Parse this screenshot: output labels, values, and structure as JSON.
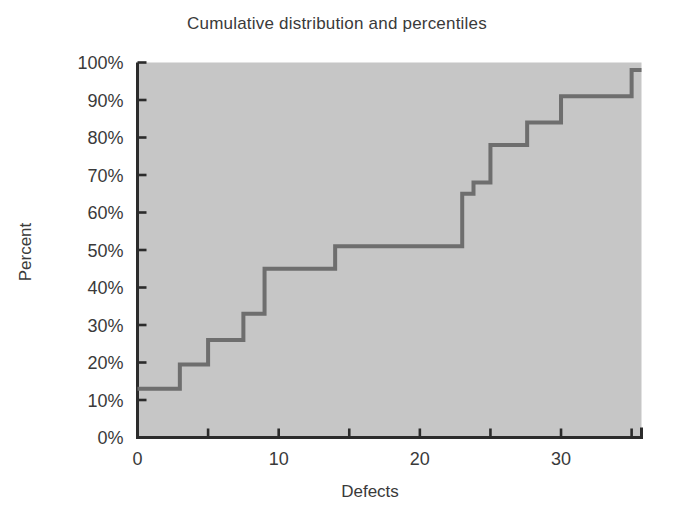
{
  "chart_data": {
    "type": "line",
    "subtype": "step-cumulative",
    "title": "Cumulative distribution and percentiles",
    "xlabel": "Defects",
    "ylabel": "Percent",
    "xlim": [
      0,
      35.7
    ],
    "ylim": [
      0,
      100
    ],
    "xticks": [
      0,
      10,
      20,
      30
    ],
    "xtick_labels": [
      "0",
      "10",
      "20",
      "30"
    ],
    "xminor_ticks": [
      5,
      15,
      25,
      35
    ],
    "yticks": [
      0,
      10,
      20,
      30,
      40,
      50,
      60,
      70,
      80,
      90,
      100
    ],
    "ytick_labels": [
      "0%",
      "10%",
      "20%",
      "30%",
      "40%",
      "50%",
      "60%",
      "70%",
      "80%",
      "90%",
      "100%"
    ],
    "grid": false,
    "legend": false,
    "plot_background": "#c6c6c6",
    "line_color": "#6e6e6e",
    "axis_color": "#2b2b2b",
    "text_color": "#3a3a3a",
    "series": [
      {
        "name": "Cumulative percent",
        "step_points": [
          {
            "x": 0.0,
            "y": 13
          },
          {
            "x": 3.0,
            "y": 13
          },
          {
            "x": 3.0,
            "y": 19.5
          },
          {
            "x": 5.0,
            "y": 19.5
          },
          {
            "x": 5.0,
            "y": 26
          },
          {
            "x": 7.5,
            "y": 26
          },
          {
            "x": 7.5,
            "y": 33
          },
          {
            "x": 9.0,
            "y": 33
          },
          {
            "x": 9.0,
            "y": 45
          },
          {
            "x": 14.0,
            "y": 45
          },
          {
            "x": 14.0,
            "y": 51
          },
          {
            "x": 23.0,
            "y": 51
          },
          {
            "x": 23.0,
            "y": 65
          },
          {
            "x": 23.8,
            "y": 65
          },
          {
            "x": 23.8,
            "y": 68
          },
          {
            "x": 25.0,
            "y": 68
          },
          {
            "x": 25.0,
            "y": 78
          },
          {
            "x": 27.6,
            "y": 78
          },
          {
            "x": 27.6,
            "y": 84
          },
          {
            "x": 30.0,
            "y": 84
          },
          {
            "x": 30.0,
            "y": 91
          },
          {
            "x": 35.0,
            "y": 91
          },
          {
            "x": 35.0,
            "y": 98
          },
          {
            "x": 35.7,
            "y": 98
          }
        ]
      }
    ]
  }
}
